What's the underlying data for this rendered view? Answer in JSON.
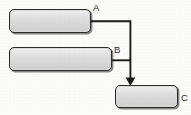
{
  "diagram": {
    "type": "flow-diagram",
    "background_color": "#fbfbf9",
    "node_fill_color": "#d9d9d9",
    "node_border_color": "#2b2b2b",
    "connector_color": "#1a1a1a",
    "label_color": "#1e1e1e",
    "canvas": {
      "width": 191,
      "height": 115
    },
    "nodes": [
      {
        "id": "a",
        "label": "A",
        "label_text": "",
        "shape": "rounded-rectangle",
        "x": 9,
        "y": 9,
        "width": 82,
        "height": 24
      },
      {
        "id": "b",
        "label": "B",
        "label_text": "",
        "shape": "rounded-rectangle",
        "x": 9,
        "y": 47,
        "width": 103,
        "height": 24
      },
      {
        "id": "c",
        "label": "C",
        "label_text": "",
        "shape": "rounded-rectangle",
        "x": 115,
        "y": 85,
        "width": 63,
        "height": 23
      }
    ],
    "connectors": [
      {
        "id": "a-to-c",
        "from": "a",
        "to": "c",
        "style": "orthogonal",
        "arrowhead": "filled-triangle",
        "points": "91,21 130.5,21 130.5,85"
      },
      {
        "id": "b-to-trunk",
        "from": "b",
        "to": "a-to-c",
        "style": "orthogonal",
        "arrowhead": "none",
        "points": "112,60 130.5,60"
      }
    ]
  }
}
